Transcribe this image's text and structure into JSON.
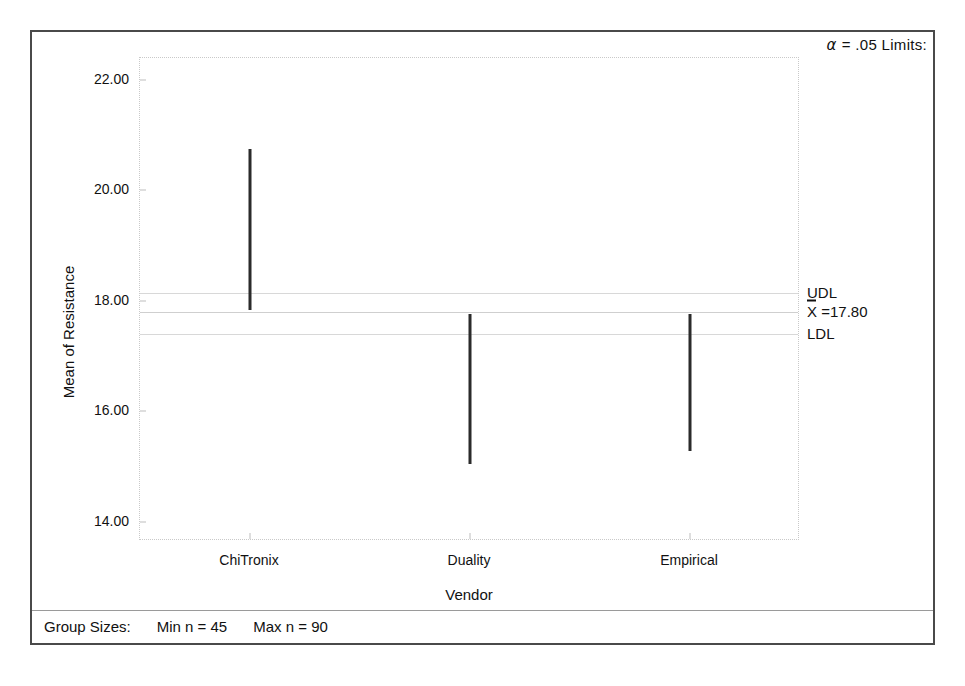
{
  "chart_data": {
    "type": "line",
    "title": "",
    "subtitle": "",
    "xlabel": "Vendor",
    "ylabel": "Mean of Resistance",
    "categories": [
      "ChiTronix",
      "Duality",
      "Empirical"
    ],
    "ylim": [
      13.65,
      22.4
    ],
    "xlim": [
      0,
      3
    ],
    "yticks": [
      "14.00",
      "16.00",
      "18.00",
      "20.00",
      "22.00"
    ],
    "ytick_values": [
      14.0,
      16.0,
      18.0,
      20.0,
      22.0
    ],
    "grid": false,
    "legend": "none",
    "series": [
      {
        "name": "Confidence interval for mean",
        "intervals": [
          {
            "category": "ChiTronix",
            "lower": 17.84,
            "upper": 20.75
          },
          {
            "category": "Duality",
            "lower": 15.04,
            "upper": 17.76
          },
          {
            "category": "Empirical",
            "lower": 15.28,
            "upper": 17.76
          }
        ]
      }
    ],
    "reference_lines": [
      {
        "name": "UDL",
        "label": "UDL",
        "value": 18.15
      },
      {
        "name": "grand_mean",
        "label": "X =17.80",
        "value": 17.8
      },
      {
        "name": "LDL",
        "label": "LDL",
        "value": 17.4
      }
    ],
    "annotations": {
      "alpha_limits": "= .05  Limits:",
      "alpha_symbol": "α ",
      "group_sizes_label": "Group Sizes:",
      "min_n": "Min n  =  45",
      "max_n": "Max n  =  90"
    }
  },
  "colors": {
    "frame": "#4a4a4a",
    "plot_border": "#c9c9c9",
    "bar": "#2b2b2b",
    "reference_line": "#d8d8d8",
    "text": "#111111",
    "background": "#ffffff"
  },
  "limit_labels": {
    "udl": "UDL",
    "mean_prefix": "X",
    "mean_value": " =17.80",
    "ldl": "LDL"
  }
}
